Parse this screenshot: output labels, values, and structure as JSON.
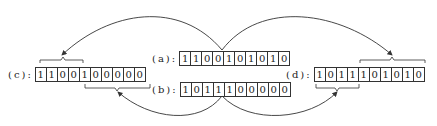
{
  "diagram": {
    "rows": [
      {
        "id": "a",
        "label": "(a):",
        "bits": [
          "1",
          "1",
          "0",
          "0",
          "1",
          "0",
          "1",
          "0",
          "1",
          "0"
        ]
      },
      {
        "id": "b",
        "label": "(b):",
        "bits": [
          "1",
          "0",
          "1",
          "1",
          "1",
          "0",
          "0",
          "0",
          "0",
          "0"
        ]
      },
      {
        "id": "c",
        "label": "(c):",
        "bits": [
          "1",
          "1",
          "0",
          "0",
          "1",
          "0",
          "0",
          "0",
          "0",
          "0"
        ]
      },
      {
        "id": "d",
        "label": "(d):",
        "bits": [
          "1",
          "0",
          "1",
          "1",
          "1",
          "0",
          "1",
          "0",
          "1",
          "0"
        ]
      }
    ],
    "line_color": "#333333"
  }
}
